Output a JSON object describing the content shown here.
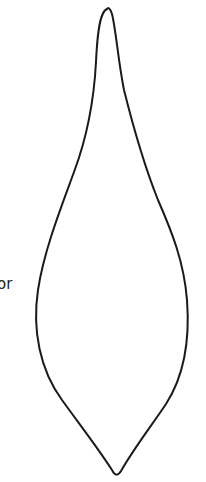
{
  "text_fragment": "or",
  "shape": {
    "type": "teardrop-outline",
    "stroke_color": "#1a1a1a",
    "fill_color": "#ffffff",
    "stroke_width": 2
  }
}
